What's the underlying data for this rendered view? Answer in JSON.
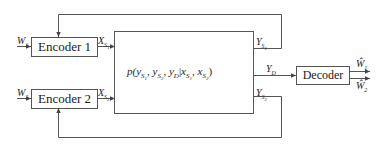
{
  "diagram": {
    "type": "block-diagram",
    "title": "",
    "blocks": {
      "encoder1": {
        "label": "Encoder 1"
      },
      "encoder2": {
        "label": "Encoder 2"
      },
      "channel": {
        "label": "p(y_{S1}, y_{S2}, y_D | x_{S1}, x_{S2})"
      },
      "decoder": {
        "label": "Decoder"
      }
    },
    "signals": {
      "w1_in": {
        "base": "W",
        "sub": "1"
      },
      "w2_in": {
        "base": "W",
        "sub": "2"
      },
      "xs1": {
        "base": "X",
        "sub": "S",
        "subsub": "1"
      },
      "xs2": {
        "base": "X",
        "sub": "S",
        "subsub": "2"
      },
      "ys1": {
        "base": "Y",
        "sub": "S",
        "subsub": "1"
      },
      "ys2": {
        "base": "Y",
        "sub": "S",
        "subsub": "2"
      },
      "yd": {
        "base": "Y",
        "sub": "D"
      },
      "w1_hat": {
        "base": "Ŵ",
        "sub": "1"
      },
      "w2_hat": {
        "base": "Ŵ",
        "sub": "2"
      }
    },
    "channel_formula": {
      "p": "p(",
      "y": "y",
      "s": "S",
      "one": "1",
      "two": "2",
      "comma": ", ",
      "d": "D",
      "bar": "|",
      "x": "x",
      "close": ")"
    },
    "connections": [
      {
        "from": "W1",
        "to": "Encoder 1"
      },
      {
        "from": "W2",
        "to": "Encoder 2"
      },
      {
        "from": "Encoder 1",
        "to": "Channel",
        "signal": "X_S1"
      },
      {
        "from": "Encoder 2",
        "to": "Channel",
        "signal": "X_S2"
      },
      {
        "from": "Channel",
        "to": "Encoder 1",
        "signal": "Y_S1",
        "feedback": true
      },
      {
        "from": "Channel",
        "to": "Encoder 2",
        "signal": "Y_S2",
        "feedback": true
      },
      {
        "from": "Channel",
        "to": "Decoder",
        "signal": "Y_D"
      },
      {
        "from": "Decoder",
        "to": "Ŵ1"
      },
      {
        "from": "Decoder",
        "to": "Ŵ2"
      }
    ]
  }
}
